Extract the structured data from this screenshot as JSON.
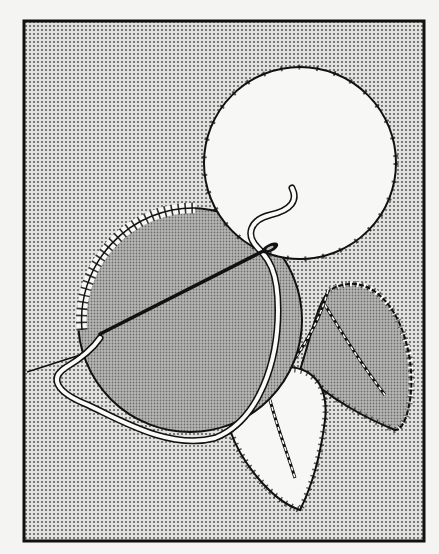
{
  "illustration": {
    "subject": "appliqué blanket-stitch embroidery with needle and thread",
    "colors": {
      "paper": "#f4f4f2",
      "ink": "#111111",
      "background_dots": "#6b6b6b",
      "fabric_gray": "#a9a9a9",
      "white_patch": "#f7f7f5"
    }
  }
}
